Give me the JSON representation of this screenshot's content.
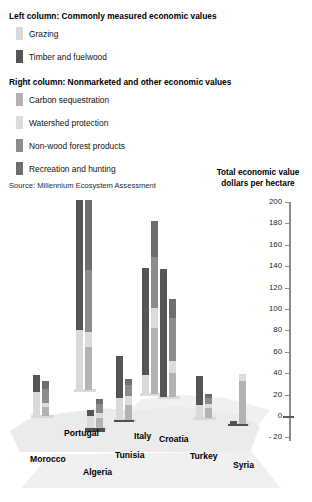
{
  "legend": {
    "heading_left": "Left column: Commonly measured economic values",
    "heading_right": "Right column: Nonmarketed and other economic values",
    "left_items": [
      {
        "label": "Grazing",
        "color": "#d9d9d9"
      },
      {
        "label": "Timber and fuelwood",
        "color": "#555555"
      }
    ],
    "right_items": [
      {
        "label": "Carbon sequestration",
        "color": "#b3b3b3"
      },
      {
        "label": "Watershed protection",
        "color": "#dcdcdc"
      },
      {
        "label": "Non-wood forest products",
        "color": "#8c8c8c"
      },
      {
        "label": "Recreation and hunting",
        "color": "#6e6e6e"
      }
    ],
    "source": "Source: Millennium Ecosystem Assessment"
  },
  "axis_title_line1": "Total economic value",
  "axis_title_line2": "dollars per hectare",
  "chart_data": {
    "type": "bar",
    "title": "Total economic value dollars per hectare",
    "xlabel": "",
    "ylabel": "Total economic value dollars per hectare",
    "ylim": [
      -20,
      200
    ],
    "ytick_labels": [
      "200",
      "180",
      "160",
      "140",
      "120",
      "100",
      "80",
      "60",
      "40",
      "20",
      "0",
      "- 20"
    ],
    "ytick_values": [
      200,
      180,
      160,
      140,
      120,
      100,
      80,
      60,
      40,
      20,
      0,
      -20
    ],
    "grid": false,
    "legend_position": "top-left",
    "stacked": true,
    "paired_columns": true,
    "categories": [
      "Morocco",
      "Portugal",
      "Algeria",
      "Tunisia",
      "Italy",
      "Croatia",
      "Turkey",
      "Syria"
    ],
    "series": [
      {
        "name": "Grazing",
        "column": "left",
        "color": "#d9d9d9",
        "values": [
          22,
          56,
          11,
          21,
          18,
          0,
          12,
          0
        ]
      },
      {
        "name": "Timber and fuelwood",
        "column": "left",
        "color": "#555555",
        "values": [
          16,
          122,
          6,
          39,
          100,
          120,
          27,
          3
        ]
      },
      {
        "name": "Carbon sequestration",
        "column": "right",
        "color": "#b3b3b3",
        "values": [
          8,
          40,
          9,
          14,
          62,
          22,
          9,
          40
        ]
      },
      {
        "name": "Watershed protection",
        "column": "right",
        "color": "#dcdcdc",
        "values": [
          4,
          14,
          5,
          8,
          18,
          12,
          4,
          7
        ]
      },
      {
        "name": "Non-wood forest products",
        "column": "right",
        "color": "#8c8c8c",
        "values": [
          13,
          58,
          8,
          11,
          48,
          40,
          6,
          0
        ]
      },
      {
        "name": "Recreation and hunting",
        "column": "right",
        "color": "#6e6e6e",
        "values": [
          8,
          66,
          5,
          5,
          34,
          18,
          3,
          0
        ]
      }
    ],
    "column_totals": {
      "left": [
        38,
        178,
        17,
        60,
        118,
        120,
        39,
        3
      ],
      "right": [
        33,
        178,
        27,
        38,
        162,
        92,
        22,
        47
      ]
    },
    "negative_values": {
      "Algeria": -7,
      "Tunisia": -2,
      "Syria": -2
    }
  }
}
